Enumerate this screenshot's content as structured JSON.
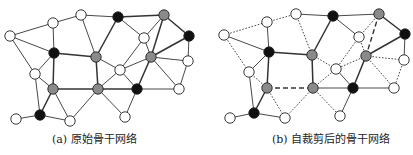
{
  "colors": {
    "white": "#ffffff",
    "gray": "#8a8a8a",
    "black": "#111111",
    "stroke": "#222222",
    "edge": "#333333"
  },
  "node_radius": 5.2,
  "captions": {
    "a": "(a) 原始骨干网络",
    "b": "(b) 自裁剪后的骨干网络"
  },
  "graphs": [
    {
      "id": "a",
      "name": "original-backbone-network",
      "nodes": {
        "A": {
          "x": 10,
          "y": 36,
          "c": "white"
        },
        "B": {
          "x": 53,
          "y": 23,
          "c": "white"
        },
        "C": {
          "x": 81,
          "y": 15,
          "c": "white"
        },
        "D": {
          "x": 118,
          "y": 17,
          "c": "black"
        },
        "E": {
          "x": 164,
          "y": 15,
          "c": "gray"
        },
        "F": {
          "x": 189,
          "y": 36,
          "c": "black"
        },
        "G": {
          "x": 144,
          "y": 38,
          "c": "white"
        },
        "H": {
          "x": 54,
          "y": 53,
          "c": "black"
        },
        "I": {
          "x": 96,
          "y": 57,
          "c": "gray"
        },
        "J": {
          "x": 151,
          "y": 57,
          "c": "gray"
        },
        "K": {
          "x": 188,
          "y": 61,
          "c": "white"
        },
        "L": {
          "x": 120,
          "y": 70,
          "c": "white"
        },
        "M": {
          "x": 35,
          "y": 74,
          "c": "white"
        },
        "N": {
          "x": 53,
          "y": 89,
          "c": "gray"
        },
        "O": {
          "x": 98,
          "y": 89,
          "c": "gray"
        },
        "P": {
          "x": 137,
          "y": 89,
          "c": "black"
        },
        "Q": {
          "x": 179,
          "y": 89,
          "c": "white"
        },
        "R": {
          "x": 40,
          "y": 115,
          "c": "black"
        },
        "S": {
          "x": 70,
          "y": 121,
          "c": "white"
        },
        "T": {
          "x": 125,
          "y": 117,
          "c": "white"
        },
        "U": {
          "x": 16,
          "y": 119,
          "c": "white"
        }
      },
      "edges": [
        [
          "A",
          "B",
          "thin"
        ],
        [
          "B",
          "C",
          "thin"
        ],
        [
          "C",
          "D",
          "thin"
        ],
        [
          "D",
          "E",
          "thick"
        ],
        [
          "E",
          "F",
          "thick"
        ],
        [
          "A",
          "H",
          "thin"
        ],
        [
          "A",
          "M",
          "thin"
        ],
        [
          "B",
          "H",
          "thin"
        ],
        [
          "C",
          "I",
          "thin"
        ],
        [
          "D",
          "I",
          "thick"
        ],
        [
          "D",
          "G",
          "thin"
        ],
        [
          "G",
          "J",
          "thin"
        ],
        [
          "G",
          "L",
          "thin"
        ],
        [
          "E",
          "G",
          "thin"
        ],
        [
          "E",
          "J",
          "thick"
        ],
        [
          "F",
          "J",
          "thick"
        ],
        [
          "F",
          "K",
          "thin"
        ],
        [
          "J",
          "K",
          "thin"
        ],
        [
          "J",
          "Q",
          "thin"
        ],
        [
          "K",
          "Q",
          "thin"
        ],
        [
          "J",
          "P",
          "thick"
        ],
        [
          "J",
          "L",
          "thin"
        ],
        [
          "H",
          "I",
          "thick"
        ],
        [
          "H",
          "M",
          "thin"
        ],
        [
          "H",
          "N",
          "thick"
        ],
        [
          "I",
          "O",
          "thick"
        ],
        [
          "I",
          "L",
          "thin"
        ],
        [
          "M",
          "N",
          "thin"
        ],
        [
          "M",
          "R",
          "thin"
        ],
        [
          "N",
          "O",
          "thick"
        ],
        [
          "N",
          "R",
          "thick"
        ],
        [
          "N",
          "S",
          "thin"
        ],
        [
          "O",
          "P",
          "thick"
        ],
        [
          "O",
          "L",
          "thin"
        ],
        [
          "O",
          "S",
          "thin"
        ],
        [
          "O",
          "T",
          "thin"
        ],
        [
          "L",
          "P",
          "thin"
        ],
        [
          "P",
          "Q",
          "thin"
        ],
        [
          "P",
          "T",
          "thin"
        ],
        [
          "R",
          "S",
          "thin"
        ],
        [
          "R",
          "U",
          "thin"
        ]
      ]
    },
    {
      "id": "b",
      "name": "self-pruned-backbone-network",
      "nodes": {
        "A": {
          "x": 224,
          "y": 35,
          "c": "white"
        },
        "B": {
          "x": 267,
          "y": 22,
          "c": "white"
        },
        "C": {
          "x": 296,
          "y": 14,
          "c": "white"
        },
        "D": {
          "x": 333,
          "y": 16,
          "c": "black"
        },
        "E": {
          "x": 379,
          "y": 14,
          "c": "gray"
        },
        "F": {
          "x": 405,
          "y": 34,
          "c": "black"
        },
        "G": {
          "x": 359,
          "y": 37,
          "c": "white"
        },
        "H": {
          "x": 269,
          "y": 52,
          "c": "black"
        },
        "I": {
          "x": 312,
          "y": 55,
          "c": "gray"
        },
        "J": {
          "x": 366,
          "y": 56,
          "c": "gray"
        },
        "K": {
          "x": 404,
          "y": 60,
          "c": "white"
        },
        "L": {
          "x": 336,
          "y": 69,
          "c": "white"
        },
        "M": {
          "x": 249,
          "y": 72,
          "c": "white"
        },
        "N": {
          "x": 267,
          "y": 88,
          "c": "gray"
        },
        "O": {
          "x": 313,
          "y": 88,
          "c": "gray"
        },
        "P": {
          "x": 353,
          "y": 88,
          "c": "black"
        },
        "Q": {
          "x": 394,
          "y": 88,
          "c": "white"
        },
        "R": {
          "x": 254,
          "y": 113,
          "c": "black"
        },
        "S": {
          "x": 285,
          "y": 118,
          "c": "white"
        },
        "T": {
          "x": 340,
          "y": 116,
          "c": "white"
        },
        "U": {
          "x": 230,
          "y": 118,
          "c": "white"
        }
      },
      "edges": [
        [
          "A",
          "B",
          "dotted"
        ],
        [
          "B",
          "C",
          "dotted"
        ],
        [
          "C",
          "D",
          "thin"
        ],
        [
          "D",
          "E",
          "thin"
        ],
        [
          "E",
          "F",
          "thick"
        ],
        [
          "A",
          "H",
          "thin"
        ],
        [
          "A",
          "M",
          "dotted"
        ],
        [
          "B",
          "H",
          "thin"
        ],
        [
          "C",
          "I",
          "dotted"
        ],
        [
          "D",
          "I",
          "thick"
        ],
        [
          "D",
          "G",
          "thin"
        ],
        [
          "G",
          "J",
          "dotted"
        ],
        [
          "G",
          "L",
          "dotted"
        ],
        [
          "E",
          "G",
          "dotted"
        ],
        [
          "E",
          "J",
          "dashed"
        ],
        [
          "F",
          "J",
          "thick"
        ],
        [
          "F",
          "K",
          "thin"
        ],
        [
          "J",
          "K",
          "dotted"
        ],
        [
          "J",
          "Q",
          "dotted"
        ],
        [
          "K",
          "Q",
          "dotted"
        ],
        [
          "J",
          "P",
          "thick"
        ],
        [
          "J",
          "L",
          "dotted"
        ],
        [
          "H",
          "I",
          "thick"
        ],
        [
          "H",
          "M",
          "thin"
        ],
        [
          "H",
          "N",
          "thick"
        ],
        [
          "I",
          "O",
          "thick"
        ],
        [
          "I",
          "L",
          "dotted"
        ],
        [
          "M",
          "N",
          "dotted"
        ],
        [
          "M",
          "R",
          "thin"
        ],
        [
          "N",
          "O",
          "dashed"
        ],
        [
          "N",
          "R",
          "thick"
        ],
        [
          "N",
          "S",
          "dotted"
        ],
        [
          "O",
          "P",
          "thin"
        ],
        [
          "O",
          "L",
          "dotted"
        ],
        [
          "O",
          "S",
          "dotted"
        ],
        [
          "O",
          "T",
          "dotted"
        ],
        [
          "L",
          "P",
          "thin"
        ],
        [
          "P",
          "Q",
          "thin"
        ],
        [
          "P",
          "T",
          "thin"
        ],
        [
          "R",
          "S",
          "thin"
        ],
        [
          "R",
          "U",
          "thin"
        ]
      ]
    }
  ]
}
